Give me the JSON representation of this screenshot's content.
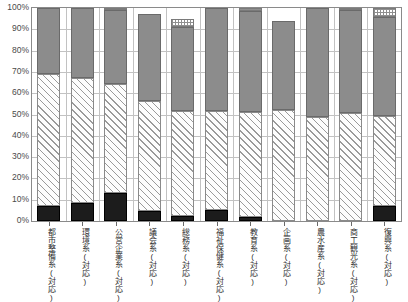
{
  "chart_data": {
    "type": "bar",
    "subtype": "stacked-100-percent",
    "title": "",
    "xlabel": "",
    "ylabel": "",
    "ylim": [
      0,
      100
    ],
    "grid": true,
    "legend_position": "none",
    "y_ticks": [
      "0%",
      "10%",
      "20%",
      "30%",
      "40%",
      "50%",
      "60%",
      "70%",
      "80%",
      "90%",
      "100%"
    ],
    "y_tick_values": [
      0,
      10,
      20,
      30,
      40,
      50,
      60,
      70,
      80,
      90,
      100
    ],
    "categories": [
      "都市整備系(対応)",
      "環境系(対応)",
      "公営企業系(対応)",
      "議会系(対応)",
      "総務系(対応)",
      "福祉保健系(対応)",
      "教育系(対応)",
      "企画系(対応)",
      "農水産系(対応)",
      "商工観光系(対応)",
      "復興系(対応)"
    ],
    "series": [
      {
        "name": "black-segment",
        "pattern": "solid-black",
        "color": "#1c1c1c",
        "values": [
          7.0,
          8.5,
          13.0,
          4.5,
          2.5,
          5.0,
          2.0,
          0.0,
          0.0,
          0.0,
          7.0
        ]
      },
      {
        "name": "hatched-segment",
        "pattern": "diagonal-hatch",
        "color": "#fdfdfd",
        "values": [
          62.0,
          58.5,
          51.5,
          52.0,
          49.0,
          46.5,
          49.0,
          52.0,
          49.0,
          50.5,
          42.5
        ]
      },
      {
        "name": "gray-segment",
        "pattern": "solid-gray",
        "color": "#8c8c8c",
        "values": [
          31.0,
          33.0,
          34.5,
          40.5,
          39.5,
          48.5,
          47.5,
          42.0,
          51.0,
          48.5,
          46.5
        ]
      },
      {
        "name": "dotted-segment",
        "pattern": "dotted",
        "color": "#ffffff",
        "values": [
          0.0,
          0.0,
          1.0,
          0.0,
          4.0,
          0.0,
          1.5,
          0.0,
          0.0,
          1.0,
          4.0
        ]
      }
    ],
    "cumulative_tops": [
      [
        7.0,
        69.0,
        100.0,
        100.0
      ],
      [
        8.5,
        67.0,
        100.0,
        100.0
      ],
      [
        13.0,
        64.5,
        99.0,
        100.0
      ],
      [
        4.5,
        56.5,
        97.0,
        97.0
      ],
      [
        2.5,
        51.5,
        91.0,
        95.0
      ],
      [
        5.0,
        51.5,
        100.0,
        100.0
      ],
      [
        2.0,
        51.0,
        98.5,
        100.0
      ],
      [
        0.0,
        52.0,
        94.0,
        94.0
      ],
      [
        0.0,
        49.0,
        100.0,
        100.0
      ],
      [
        0.0,
        50.5,
        99.0,
        100.0
      ],
      [
        7.0,
        49.5,
        96.0,
        100.0
      ]
    ]
  }
}
